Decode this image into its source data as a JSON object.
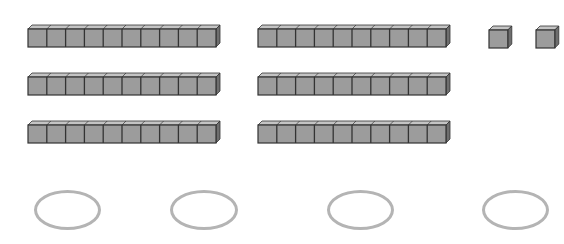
{
  "diagram": {
    "colors": {
      "block_face": "#9c9c9c",
      "block_top": "#c4c4c4",
      "block_side": "#6e6e6e",
      "block_edge": "#333333",
      "oval_stroke": "#b4b4b4"
    },
    "groups": [
      {
        "name": "tens-group-left",
        "rods": [
          {
            "x": 27,
            "y": 24,
            "units": 10
          },
          {
            "x": 27,
            "y": 72,
            "units": 10
          },
          {
            "x": 27,
            "y": 120,
            "units": 10
          }
        ]
      },
      {
        "name": "tens-group-middle",
        "rods": [
          {
            "x": 257,
            "y": 24,
            "units": 10
          },
          {
            "x": 257,
            "y": 72,
            "units": 10
          },
          {
            "x": 257,
            "y": 120,
            "units": 10
          }
        ]
      },
      {
        "name": "ones-group",
        "cubes": [
          {
            "x": 488,
            "y": 25
          },
          {
            "x": 535,
            "y": 25
          }
        ]
      }
    ],
    "answer_ovals": [
      {
        "x": 34,
        "y": 190,
        "w": 67,
        "h": 40,
        "value": ""
      },
      {
        "x": 170,
        "y": 190,
        "w": 68,
        "h": 40,
        "value": ""
      },
      {
        "x": 327,
        "y": 190,
        "w": 67,
        "h": 40,
        "value": ""
      },
      {
        "x": 482,
        "y": 190,
        "w": 67,
        "h": 40,
        "value": ""
      }
    ]
  }
}
